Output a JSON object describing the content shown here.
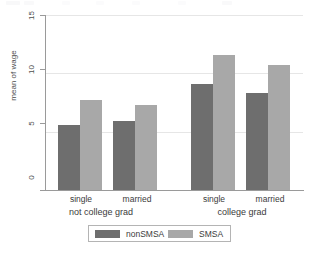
{
  "chart_data": {
    "type": "bar",
    "title": "",
    "subtitle": "",
    "xlabel": "",
    "ylabel": "mean of wage",
    "ylim": [
      0,
      15
    ],
    "yticks": [
      0,
      5,
      10,
      15
    ],
    "ytick_labels": [
      "0",
      "5",
      "10",
      "15"
    ],
    "grid": true,
    "grid_axis": "y",
    "legend_position": "bottom",
    "orientation": "vertical",
    "categories": [
      "single",
      "married",
      "single",
      "married"
    ],
    "group_labels": [
      "not college grad",
      "college grad"
    ],
    "groups": [
      {
        "label": "not college grad",
        "categories": [
          "single",
          "married"
        ]
      },
      {
        "label": "college grad",
        "categories": [
          "single",
          "married"
        ]
      }
    ],
    "series": [
      {
        "name": "nonSMSA",
        "color": "#6e6e6e",
        "values": [
          5.6,
          5.9,
          9.1,
          8.3
        ]
      },
      {
        "name": "SMSA",
        "color": "#a8a8a8",
        "values": [
          7.7,
          7.3,
          11.6,
          10.7
        ]
      }
    ],
    "bars": [
      {
        "group": "not college grad",
        "category": "single",
        "series": "nonSMSA",
        "value": 5.6
      },
      {
        "group": "not college grad",
        "category": "single",
        "series": "SMSA",
        "value": 7.7
      },
      {
        "group": "not college grad",
        "category": "married",
        "series": "nonSMSA",
        "value": 5.9
      },
      {
        "group": "not college grad",
        "category": "married",
        "series": "SMSA",
        "value": 7.3
      },
      {
        "group": "college grad",
        "category": "single",
        "series": "nonSMSA",
        "value": 9.1
      },
      {
        "group": "college grad",
        "category": "single",
        "series": "SMSA",
        "value": 11.6
      },
      {
        "group": "college grad",
        "category": "married",
        "series": "nonSMSA",
        "value": 8.3
      },
      {
        "group": "college grad",
        "category": "married",
        "series": "SMSA",
        "value": 10.7
      }
    ]
  },
  "axes": {
    "y": {
      "label": "mean of wage",
      "ticks": [
        {
          "value": 15,
          "label": "15"
        },
        {
          "value": 10,
          "label": "10"
        },
        {
          "value": 5,
          "label": "5"
        },
        {
          "value": 0,
          "label": "0"
        }
      ]
    },
    "x": {
      "categories": [
        {
          "label": "single"
        },
        {
          "label": "married"
        },
        {
          "label": "single"
        },
        {
          "label": "married"
        }
      ],
      "groups": [
        {
          "label": "not college grad"
        },
        {
          "label": "college grad"
        }
      ]
    }
  },
  "legend": {
    "entries": [
      {
        "label": "nonSMSA",
        "color": "#6e6e6e"
      },
      {
        "label": "SMSA",
        "color": "#a8a8a8"
      }
    ]
  },
  "colors": {
    "nonsmsa": "#6e6e6e",
    "smsa": "#a8a8a8",
    "axis": "#9a9a9a",
    "grid": "#e6e6e6",
    "text": "#3b3b3b",
    "background": "#ffffff"
  }
}
